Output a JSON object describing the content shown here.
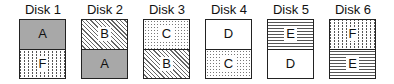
{
  "diagram": {
    "type": "disk-layout",
    "disks": [
      {
        "label": "Disk 1",
        "left": 19,
        "blocks": [
          {
            "label": "A",
            "pattern": "solid"
          },
          {
            "label": "F",
            "pattern": "vdots"
          }
        ]
      },
      {
        "label": "Disk 2",
        "left": 81,
        "blocks": [
          {
            "label": "B",
            "pattern": "diag"
          },
          {
            "label": "A",
            "pattern": "solid"
          }
        ]
      },
      {
        "label": "Disk 3",
        "left": 143,
        "blocks": [
          {
            "label": "C",
            "pattern": "dots"
          },
          {
            "label": "B",
            "pattern": "diag"
          }
        ]
      },
      {
        "label": "Disk 4",
        "left": 205,
        "blocks": [
          {
            "label": "D",
            "pattern": "white"
          },
          {
            "label": "C",
            "pattern": "dots"
          }
        ]
      },
      {
        "label": "Disk 5",
        "left": 267,
        "blocks": [
          {
            "label": "E",
            "pattern": "hlines"
          },
          {
            "label": "D",
            "pattern": "white"
          }
        ]
      },
      {
        "label": "Disk 6",
        "left": 329,
        "blocks": [
          {
            "label": "F",
            "pattern": "vdots"
          },
          {
            "label": "E",
            "pattern": "hlines"
          }
        ]
      }
    ]
  }
}
